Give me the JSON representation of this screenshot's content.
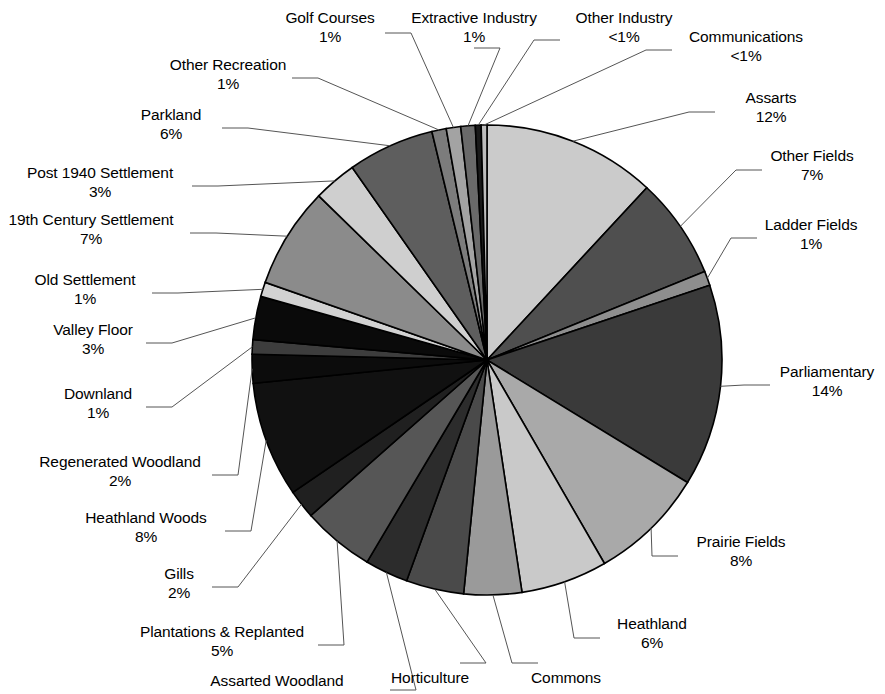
{
  "chart_data": {
    "type": "pie",
    "title": "",
    "subtitle": "",
    "xlabel": "",
    "ylabel": "",
    "legend_position": "labels-with-leader-lines",
    "grid": false,
    "start_angle_deg": -90,
    "direction": "clockwise",
    "categories": [
      "Assarts",
      "Other Fields",
      "Ladder Fields",
      "Parliamentary",
      "Prairie Fields",
      "Heathland",
      "Commons",
      "Horticulture",
      "Assarted Woodland",
      "Plantations & Replanted",
      "Gills",
      "Heathland Woods",
      "Regenerated Woodland",
      "Downland",
      "Valley Floor",
      "Old Settlement",
      "19th Century Settlement",
      "Post 1940 Settlement",
      "Parkland",
      "Other Recreation",
      "Golf Courses",
      "Extractive Industry",
      "Other Industry",
      "Communications"
    ],
    "values": [
      12,
      7,
      1,
      14,
      8,
      6,
      4,
      4,
      3,
      5,
      2,
      8,
      2,
      1,
      3,
      1,
      7,
      3,
      6,
      1,
      1,
      1,
      0.4,
      0.4
    ],
    "value_labels": [
      "12%",
      "7%",
      "1%",
      "14%",
      "8%",
      "6%",
      "4%",
      "4%",
      "3%",
      "5%",
      "2%",
      "8%",
      "2%",
      "1%",
      "3%",
      "1%",
      "7%",
      "3%",
      "6%",
      "1%",
      "1%",
      "1%",
      "<1%",
      "<1%"
    ],
    "slice_fills": [
      "#cbcbcb",
      "#4f4f4f",
      "#8e8e8e",
      "#3a3a3a",
      "#a9a9a9",
      "#c9c9c9",
      "#9a9a9a",
      "#4a4a4a",
      "#2c2c2c",
      "#565656",
      "#202020",
      "#111111",
      "#0c0c0c",
      "#3d3d3d",
      "#0a0a0a",
      "#d2d2d2",
      "#8b8b8b",
      "#cfcfcf",
      "#5e5e5e",
      "#7c7c7c",
      "#a3a3a3",
      "#6a6a6a",
      "#1a1a1a",
      "#bdbdbd"
    ]
  },
  "labels": [
    {
      "name": "Golf Courses",
      "pct": "1%"
    },
    {
      "name": "Extractive Industry",
      "pct": "1%"
    },
    {
      "name": "Other Industry",
      "pct": "<1%"
    },
    {
      "name": "Communications",
      "pct": "<1%"
    },
    {
      "name": "Other Recreation",
      "pct": "1%"
    },
    {
      "name": "Assarts",
      "pct": "12%"
    },
    {
      "name": "Parkland",
      "pct": "6%"
    },
    {
      "name": "Other Fields",
      "pct": "7%"
    },
    {
      "name": "Post 1940 Settlement",
      "pct": "3%"
    },
    {
      "name": "Ladder Fields",
      "pct": "1%"
    },
    {
      "name": "19th Century Settlement",
      "pct": "7%"
    },
    {
      "name": "Old Settlement",
      "pct": "1%"
    },
    {
      "name": "Valley Floor",
      "pct": "3%"
    },
    {
      "name": "Parliamentary",
      "pct": "14%"
    },
    {
      "name": "Downland",
      "pct": "1%"
    },
    {
      "name": "Regenerated Woodland",
      "pct": "2%"
    },
    {
      "name": "Heathland Woods",
      "pct": "8%"
    },
    {
      "name": "Prairie Fields",
      "pct": "8%"
    },
    {
      "name": "Gills",
      "pct": "2%"
    },
    {
      "name": "Heathland",
      "pct": "6%"
    },
    {
      "name": "Plantations & Replanted",
      "pct": "5%"
    },
    {
      "name": "Assarted Woodland",
      "pct": ""
    },
    {
      "name": "Horticulture",
      "pct": ""
    },
    {
      "name": "Commons",
      "pct": ""
    }
  ],
  "colors": {
    "background": "#ffffff",
    "text": "#000000",
    "leader_line": "#555555",
    "slice_outline": "#000000"
  }
}
